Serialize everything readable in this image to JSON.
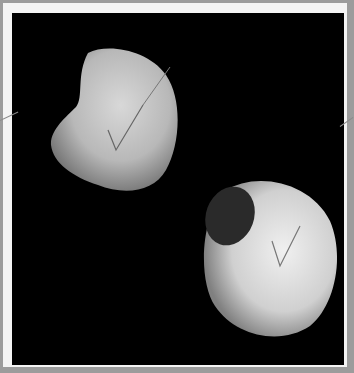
{
  "image": {
    "description": "Two pale pebble/seed-like objects photographed on black background, framed with white border",
    "frame_color": "#f4f4f4",
    "background_color": "#000000",
    "outer_color": "#9c9c9c",
    "objects": [
      {
        "name": "kidney-shaped-pebble",
        "position": "upper-left"
      },
      {
        "name": "rounded-hollow-pebble",
        "position": "lower-right"
      }
    ]
  }
}
